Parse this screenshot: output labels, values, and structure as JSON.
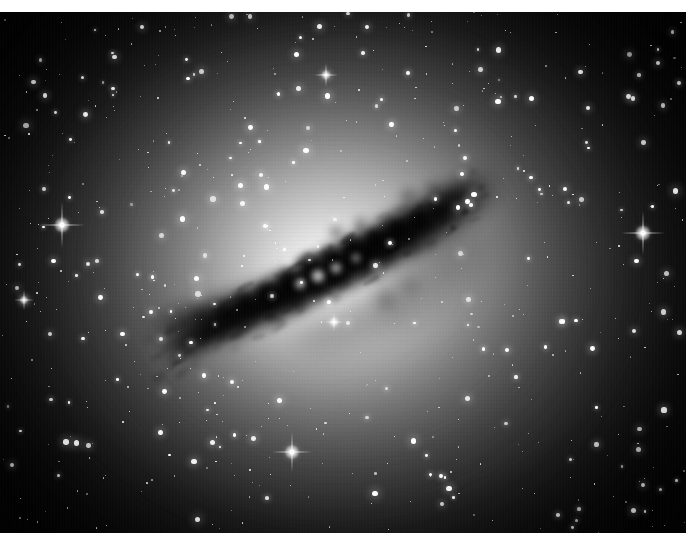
{
  "image": {
    "subject_name": "Centaurus A (NGC 5128)",
    "object_type": "peculiar elliptical galaxy",
    "description": "Monochrome astrophotograph of an elliptical galaxy crossed by a prominent dark dust lane, set in a dense field of stars",
    "palette": "grayscale",
    "width": 699,
    "height": 542,
    "alt_text": "Black and white photograph of the galaxy Centaurus A with its dark dust lane"
  },
  "border": {
    "color": "#ffffff",
    "top": 12,
    "right": 13,
    "bottom": 9,
    "left": 0
  },
  "plate": {
    "x": 0,
    "y": 12,
    "width": 686,
    "height": 521,
    "background_color": "#010101",
    "deep_sky_color": "#050505"
  },
  "galaxy": {
    "center_x": 340,
    "center_y": 268,
    "core_color": "#ffffff",
    "halo_color": "#8a8a8a",
    "dust_color": "#141414",
    "halo_layers": [
      {
        "cx": 340,
        "cy": 272,
        "rx": 300,
        "ry": 250,
        "color": "rgba(150,150,150,0.30)",
        "blur": 95
      },
      {
        "cx": 338,
        "cy": 270,
        "rx": 236,
        "ry": 196,
        "color": "rgba(176,176,176,0.42)",
        "blur": 78
      },
      {
        "cx": 336,
        "cy": 268,
        "rx": 178,
        "ry": 150,
        "color": "rgba(200,200,200,0.50)",
        "blur": 60
      },
      {
        "cx": 334,
        "cy": 266,
        "rx": 126,
        "ry": 108,
        "color": "rgba(222,222,222,0.58)",
        "blur": 44
      },
      {
        "cx": 332,
        "cy": 272,
        "rx": 84,
        "ry": 72,
        "color": "rgba(240,240,240,0.66)",
        "blur": 32
      },
      {
        "cx": 330,
        "cy": 280,
        "rx": 52,
        "ry": 44,
        "color": "rgba(252,252,252,0.78)",
        "blur": 22
      },
      {
        "cx": 327,
        "cy": 286,
        "rx": 30,
        "ry": 25,
        "color": "rgba(255,255,255,0.90)",
        "blur": 15
      },
      {
        "cx": 322,
        "cy": 292,
        "rx": 16,
        "ry": 13,
        "color": "rgba(255,255,255,0.95)",
        "blur": 9
      }
    ],
    "dust_lane": {
      "angle_deg": -27,
      "bands": [
        {
          "cx": 300,
          "cy": 286,
          "rx": 150,
          "ry": 15,
          "rot": -27,
          "color": "rgba(2,2,2,0.90)",
          "blur": 9
        },
        {
          "cx": 372,
          "cy": 250,
          "rx": 118,
          "ry": 15,
          "rot": -31,
          "color": "rgba(4,4,4,0.84)",
          "blur": 10
        },
        {
          "cx": 236,
          "cy": 308,
          "rx": 74,
          "ry": 12,
          "rot": -18,
          "color": "rgba(6,6,6,0.74)",
          "blur": 10
        },
        {
          "cx": 424,
          "cy": 224,
          "rx": 72,
          "ry": 14,
          "rot": -34,
          "color": "rgba(10,10,10,0.64)",
          "blur": 12
        },
        {
          "cx": 318,
          "cy": 272,
          "rx": 135,
          "ry": 9,
          "rot": -27,
          "color": "rgba(0,0,0,0.70)",
          "blur": 7
        },
        {
          "cx": 282,
          "cy": 300,
          "rx": 120,
          "ry": 10,
          "rot": -24,
          "color": "rgba(0,0,0,0.60)",
          "blur": 8
        },
        {
          "cx": 400,
          "cy": 238,
          "rx": 90,
          "ry": 10,
          "rot": -32,
          "color": "rgba(8,8,8,0.55)",
          "blur": 9
        },
        {
          "cx": 452,
          "cy": 212,
          "rx": 52,
          "ry": 12,
          "rot": -38,
          "color": "rgba(18,18,18,0.50)",
          "blur": 12
        },
        {
          "cx": 196,
          "cy": 318,
          "rx": 48,
          "ry": 9,
          "rot": -12,
          "color": "rgba(12,12,12,0.48)",
          "blur": 11
        },
        {
          "cx": 352,
          "cy": 322,
          "rx": 62,
          "ry": 22,
          "rot": -20,
          "color": "rgba(20,20,20,0.32)",
          "blur": 16
        },
        {
          "cx": 430,
          "cy": 272,
          "rx": 60,
          "ry": 30,
          "rot": -40,
          "color": "rgba(24,24,24,0.30)",
          "blur": 18
        }
      ],
      "blobs": [
        {
          "cx": 310,
          "cy": 266,
          "r": 11,
          "color": "rgba(0,0,0,0.82)",
          "blur": 4
        },
        {
          "cx": 330,
          "cy": 256,
          "r": 9,
          "color": "rgba(0,0,0,0.78)",
          "blur": 4
        },
        {
          "cx": 352,
          "cy": 246,
          "r": 10,
          "color": "rgba(0,0,0,0.76)",
          "blur": 4
        },
        {
          "cx": 374,
          "cy": 238,
          "r": 8,
          "color": "rgba(0,0,0,0.74)",
          "blur": 4
        },
        {
          "cx": 396,
          "cy": 228,
          "r": 9,
          "color": "rgba(0,0,0,0.70)",
          "blur": 5
        },
        {
          "cx": 418,
          "cy": 218,
          "r": 8,
          "color": "rgba(0,0,0,0.62)",
          "blur": 5
        },
        {
          "cx": 440,
          "cy": 210,
          "r": 7,
          "color": "rgba(0,0,0,0.52)",
          "blur": 6
        },
        {
          "cx": 288,
          "cy": 280,
          "r": 10,
          "color": "rgba(0,0,0,0.80)",
          "blur": 4
        },
        {
          "cx": 266,
          "cy": 292,
          "r": 9,
          "color": "rgba(0,0,0,0.76)",
          "blur": 4
        },
        {
          "cx": 244,
          "cy": 302,
          "r": 8,
          "color": "rgba(0,0,0,0.70)",
          "blur": 5
        },
        {
          "cx": 222,
          "cy": 310,
          "r": 7,
          "color": "rgba(0,0,0,0.60)",
          "blur": 5
        },
        {
          "cx": 202,
          "cy": 316,
          "r": 6,
          "color": "rgba(0,0,0,0.48)",
          "blur": 6
        },
        {
          "cx": 318,
          "cy": 288,
          "r": 7,
          "color": "rgba(0,0,0,0.60)",
          "blur": 4
        },
        {
          "cx": 342,
          "cy": 278,
          "r": 6,
          "color": "rgba(0,0,0,0.55)",
          "blur": 4
        },
        {
          "cx": 366,
          "cy": 266,
          "r": 7,
          "color": "rgba(0,0,0,0.50)",
          "blur": 5
        },
        {
          "cx": 390,
          "cy": 256,
          "r": 6,
          "color": "rgba(0,0,0,0.45)",
          "blur": 5
        },
        {
          "cx": 412,
          "cy": 248,
          "r": 7,
          "color": "rgba(0,0,0,0.42)",
          "blur": 6
        },
        {
          "cx": 298,
          "cy": 306,
          "r": 6,
          "color": "rgba(0,0,0,0.46)",
          "blur": 5
        },
        {
          "cx": 274,
          "cy": 318,
          "r": 6,
          "color": "rgba(0,0,0,0.42)",
          "blur": 5
        },
        {
          "cx": 408,
          "cy": 196,
          "r": 7,
          "color": "rgba(0,0,0,0.40)",
          "blur": 6
        },
        {
          "cx": 432,
          "cy": 188,
          "r": 6,
          "color": "rgba(0,0,0,0.34)",
          "blur": 6
        },
        {
          "cx": 452,
          "cy": 196,
          "r": 7,
          "color": "rgba(0,0,0,0.30)",
          "blur": 7
        },
        {
          "cx": 386,
          "cy": 300,
          "r": 8,
          "color": "rgba(0,0,0,0.30)",
          "blur": 7
        },
        {
          "cx": 410,
          "cy": 286,
          "r": 7,
          "color": "rgba(0,0,0,0.28)",
          "blur": 7
        },
        {
          "cx": 336,
          "cy": 232,
          "r": 6,
          "color": "rgba(0,0,0,0.40)",
          "blur": 5
        },
        {
          "cx": 360,
          "cy": 222,
          "r": 5,
          "color": "rgba(0,0,0,0.36)",
          "blur": 5
        }
      ],
      "bright_knots": [
        {
          "cx": 318,
          "cy": 276,
          "r": 6,
          "color": "rgba(255,255,255,0.75)"
        },
        {
          "cx": 336,
          "cy": 268,
          "r": 5,
          "color": "rgba(255,255,255,0.65)"
        },
        {
          "cx": 300,
          "cy": 284,
          "r": 5,
          "color": "rgba(255,255,255,0.60)"
        },
        {
          "cx": 356,
          "cy": 258,
          "r": 4,
          "color": "rgba(255,255,255,0.50)"
        },
        {
          "cx": 288,
          "cy": 262,
          "r": 4,
          "color": "rgba(255,255,255,0.55)"
        }
      ]
    }
  },
  "bright_stars": [
    {
      "x": 62,
      "y": 225,
      "core": 5,
      "glow": 16,
      "spike": 46,
      "name": "bright-star-left"
    },
    {
      "x": 643,
      "y": 233,
      "core": 5,
      "glow": 16,
      "spike": 44,
      "name": "bright-star-right"
    },
    {
      "x": 292,
      "y": 452,
      "core": 5,
      "glow": 15,
      "spike": 40,
      "name": "bright-star-bottom"
    },
    {
      "x": 326,
      "y": 75,
      "core": 3,
      "glow": 10,
      "spike": 24,
      "name": "bright-star-top"
    },
    {
      "x": 24,
      "y": 300,
      "core": 3,
      "glow": 9,
      "spike": 20,
      "name": "bright-star-left-lower"
    },
    {
      "x": 334,
      "y": 322,
      "core": 3,
      "glow": 10,
      "spike": 18,
      "name": "bright-star-core-field"
    }
  ],
  "starfield": {
    "description": "Dense field of foreground Milky Way stars across the plate",
    "approx_count": 620,
    "seed": 20250614,
    "size_range_px": [
      1,
      4
    ],
    "star_color": "#ffffff"
  },
  "caption": {
    "visible": false,
    "text": ""
  }
}
